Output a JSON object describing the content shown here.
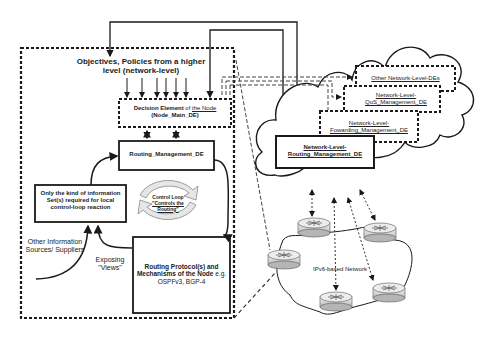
{
  "diagram": {
    "type": "architecture",
    "node_box": {
      "objectives_title": "Objectives, Policies from a higher level (network-level)",
      "decision_element": {
        "line1_bold": "Decision Element",
        "line1_rest": " of ",
        "line1_link": "the Node",
        "line2": "(Node_Main_DE)"
      },
      "routing_management": "Routing_Management_DE",
      "info_sets": "Only the kind of information Set(s) required for local control-loop reaction",
      "control_loop": {
        "title": "Control Loop",
        "sub1": "\"Controls the",
        "sub2": "Routing\""
      },
      "other_sources": "Other Information Sources/ Suppliers",
      "exposing_views": "Exposing \"Views\"",
      "routing_protocols": {
        "bold": "Routing Protocol(s) and Mechanisms of the Node",
        "rest": " e.g. OSPFv3, BGP-4"
      }
    },
    "cloud": {
      "other_des": "Other Network-Level-DEs",
      "qos": "Network-Level-QoS_Management_DE",
      "forwarding": "Network-Level-Fowarding_Management_DE",
      "routing": "Network-Level-Routing_Management_DE"
    },
    "network": {
      "label": "IPv6-based Network",
      "router_count": 5
    },
    "colors": {
      "line": "#1a1a1a",
      "dashed": "#444444",
      "loop_fill": "#e6e6e6"
    }
  }
}
